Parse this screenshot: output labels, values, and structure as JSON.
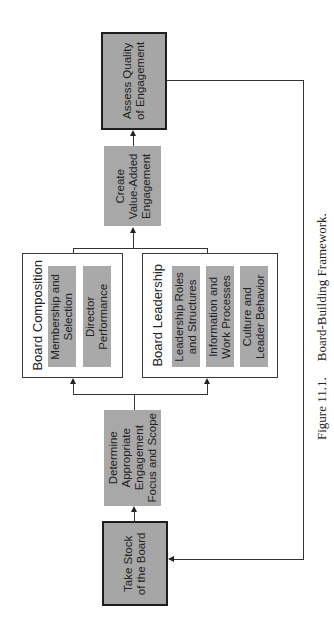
{
  "diagram": {
    "title": "Board-Building Framework",
    "nodes": {
      "take_stock": {
        "line1": "Take Stock",
        "line2": "of the Board"
      },
      "determine": {
        "line1": "Determine",
        "line2": "Appropriate",
        "line3": "Engagement",
        "line4": "Focus and Scope"
      },
      "board_composition": {
        "title": "Board Composition",
        "items": [
          {
            "line1": "Membership and",
            "line2": "Selection"
          },
          {
            "line1": "Director",
            "line2": "Performance"
          }
        ]
      },
      "board_leadership": {
        "title": "Board Leadership",
        "items": [
          {
            "line1": "Leadership Roles",
            "line2": "and Structures"
          },
          {
            "line1": "Information and",
            "line2": "Work Processes"
          },
          {
            "line1": "Culture and",
            "line2": "Leader Behavior"
          }
        ]
      },
      "create": {
        "line1": "Create",
        "line2": "Value-Added",
        "line3": "Engagement"
      },
      "assess": {
        "line1": "Assess Quality",
        "line2": "of Engagement"
      }
    },
    "colors": {
      "box_fill": "#a8a8a8",
      "border_dark": "#1e1e1e",
      "line": "#333333"
    }
  },
  "caption": {
    "number": "Figure 11.1.",
    "text": "Board-Building Framework."
  }
}
